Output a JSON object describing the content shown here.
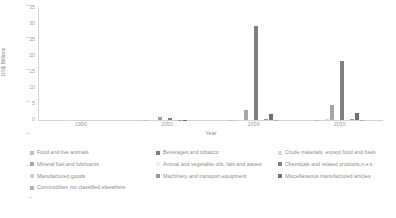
{
  "chart_data": {
    "type": "bar",
    "title": "",
    "xlabel": "Year",
    "ylabel": "US$ Billions",
    "categories": [
      "1990",
      "2001",
      "2009",
      "2015"
    ],
    "ylim": [
      0,
      35
    ],
    "yticks": [
      "0",
      "5",
      "10",
      "15",
      "20",
      "25",
      "30",
      "35"
    ],
    "grid": false,
    "legend_position": "bottom",
    "series": [
      {
        "name": "Food and live animals",
        "color": "#bfbfbf",
        "values": [
          0.0,
          0.05,
          0.08,
          0.1
        ]
      },
      {
        "name": "Beverages and tobacco",
        "color": "#7f7f7f",
        "values": [
          0.0,
          0.02,
          0.02,
          0.02
        ]
      },
      {
        "name": "Crude materials, except food and fuels",
        "color": "#d9d9d9",
        "values": [
          0.0,
          0.03,
          0.05,
          0.25
        ]
      },
      {
        "name": "Mineral fuel and lubricants",
        "color": "#a6a6a6",
        "values": [
          0.0,
          0.9,
          3.2,
          4.6
        ]
      },
      {
        "name": "Animal and vegetable oils, fats and waxes",
        "color": "#efefef",
        "values": [
          0.0,
          0.01,
          0.02,
          0.02
        ]
      },
      {
        "name": "Chemicals and related products,n.e.s",
        "color": "#808080",
        "values": [
          0.0,
          0.6,
          29.5,
          18.5
        ]
      },
      {
        "name": "Manufactured goods",
        "color": "#cccccc",
        "values": [
          0.0,
          0.04,
          0.1,
          0.12
        ]
      },
      {
        "name": "Machinery and transport equipment",
        "color": "#9a9a9a",
        "values": [
          0.0,
          0.05,
          0.35,
          0.2
        ]
      },
      {
        "name": "Miscellaneous manufactured articles",
        "color": "#6e6e6e",
        "values": [
          0.0,
          0.1,
          2.0,
          2.1
        ]
      },
      {
        "name": "Commodities not classified elsewhere",
        "color": "#b3b3b3",
        "values": [
          0.0,
          0.02,
          0.05,
          0.05
        ]
      }
    ]
  },
  "axis": {
    "y_title": "US$ Billions",
    "x_title": "Year"
  }
}
